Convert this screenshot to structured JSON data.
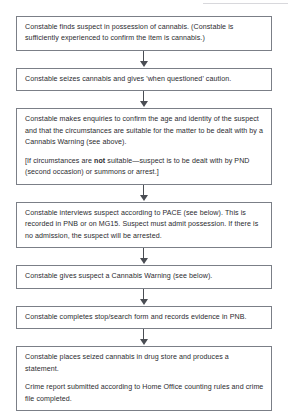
{
  "document": {
    "type": "process-flowchart",
    "title": "Cannabis Warning procedure flowchart",
    "orientation": "vertical-top-to-bottom",
    "colors": {
      "box_border": "#7b7f87",
      "box_fill": "#ffffff",
      "text": "#2b2b2f",
      "arrow": "#4a4d53",
      "page_background": "#ffffff"
    }
  },
  "nodes": [
    {
      "id": "node-1",
      "paragraphs": [
        "Constable finds suspect in possession of cannabis. (Constable is sufficiently experienced to confirm the item is cannabis.)"
      ]
    },
    {
      "id": "node-2",
      "paragraphs": [
        "Constable seizes cannabis and gives 'when questioned' caution."
      ]
    },
    {
      "id": "node-3",
      "paragraphs": [
        "Constable makes enquiries to confirm the age and identity of the suspect and that the circumstances are suitable for the matter to be dealt with by a Cannabis Warning (see above).",
        "[If circumstances are not suitable—suspect is to be dealt with by PND (second occasion) or summons or arrest.]"
      ],
      "emphasis": {
        "bold_word": "not"
      }
    },
    {
      "id": "node-4",
      "paragraphs": [
        "Constable interviews suspect according to PACE (see below). This is recorded in PNB or on MG15. Suspect must admit possession. If there is no admission, the suspect will be arrested."
      ]
    },
    {
      "id": "node-5",
      "paragraphs": [
        "Constable gives suspect a Cannabis Warning (see below)."
      ]
    },
    {
      "id": "node-6",
      "paragraphs": [
        "Constable completes stop/search form and records evidence in PNB."
      ]
    },
    {
      "id": "node-7",
      "paragraphs": [
        "Constable places seized cannabis in drug store and produces a statement.",
        "Crime report submitted according to Home Office counting rules and crime file completed."
      ]
    }
  ],
  "connectors": [
    {
      "id": "arrow-1",
      "from": "node-1",
      "to": "node-2",
      "shape": "down-arrow"
    },
    {
      "id": "arrow-2",
      "from": "node-2",
      "to": "node-3",
      "shape": "down-arrow"
    },
    {
      "id": "arrow-3",
      "from": "node-3",
      "to": "node-4",
      "shape": "down-arrow"
    },
    {
      "id": "arrow-4",
      "from": "node-4",
      "to": "node-5",
      "shape": "down-arrow"
    },
    {
      "id": "arrow-5",
      "from": "node-5",
      "to": "node-6",
      "shape": "down-arrow"
    },
    {
      "id": "arrow-6",
      "from": "node-6",
      "to": "node-7",
      "shape": "down-arrow"
    }
  ]
}
